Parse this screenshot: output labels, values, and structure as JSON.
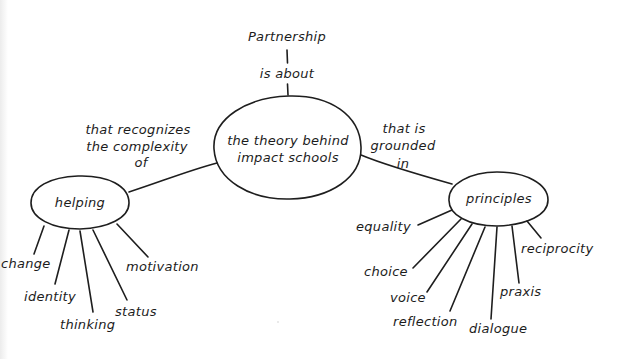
{
  "diagram": {
    "type": "concept-map",
    "style": "hand-drawn",
    "colors": {
      "background": "#ffffff",
      "ink": "#1e1e1e"
    },
    "root": {
      "label": "Partnership",
      "link_label": "is about"
    },
    "center_node": {
      "line1": "the theory behind",
      "line2": "impact schools"
    },
    "left_branch": {
      "link_line1": "that recognizes",
      "link_line2": "the complexity",
      "link_line3": "of",
      "node_label": "helping",
      "children": [
        {
          "label": "change"
        },
        {
          "label": "identity"
        },
        {
          "label": "thinking"
        },
        {
          "label": "status"
        },
        {
          "label": "motivation"
        }
      ]
    },
    "right_branch": {
      "link_line1": "that is",
      "link_line2": "grounded",
      "link_line3": "in",
      "node_label": "principles",
      "children": [
        {
          "label": "equality"
        },
        {
          "label": "choice"
        },
        {
          "label": "voice"
        },
        {
          "label": "reflection"
        },
        {
          "label": "dialogue"
        },
        {
          "label": "praxis"
        },
        {
          "label": "reciprocity"
        }
      ]
    }
  }
}
